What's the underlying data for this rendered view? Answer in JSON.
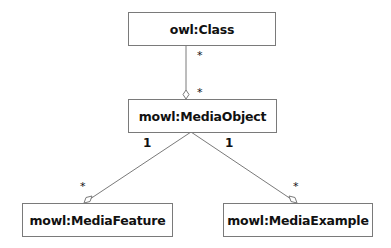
{
  "diagram": {
    "type": "uml-class-diagram",
    "nodes": [
      {
        "id": "owl_class",
        "label": "owl:Class"
      },
      {
        "id": "media_object",
        "label": "mowl:MediaObject"
      },
      {
        "id": "media_feature",
        "label": "mowl:MediaFeature"
      },
      {
        "id": "media_example",
        "label": "mowl:MediaExample"
      }
    ],
    "edges": [
      {
        "from": "owl_class",
        "to": "media_object",
        "source_multiplicity": "*",
        "target_multiplicity": "*",
        "arrowhead": "hollow-diamond"
      },
      {
        "from": "media_object",
        "to": "media_feature",
        "source_multiplicity": "1",
        "target_multiplicity": "*",
        "arrowhead": "hollow-diamond"
      },
      {
        "from": "media_object",
        "to": "media_example",
        "source_multiplicity": "1",
        "target_multiplicity": "*",
        "arrowhead": "hollow-diamond"
      }
    ]
  },
  "colors": {
    "line": "#7a7a7a",
    "text": "#111111",
    "background": "#ffffff"
  }
}
